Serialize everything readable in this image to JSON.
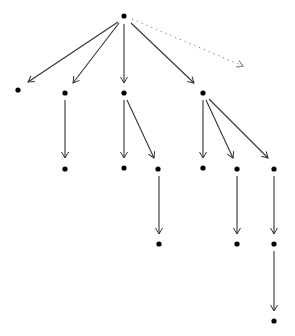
{
  "diagram": {
    "type": "tree",
    "width": 295,
    "height": 336,
    "colors": {
      "node": "#000000",
      "edge": "#333333",
      "dotted_edge": "#777777",
      "background": "#ffffff"
    },
    "node_radius": 2.6,
    "nodes": [
      {
        "id": "root",
        "x": 124,
        "y": 16
      },
      {
        "id": "a",
        "x": 18,
        "y": 90
      },
      {
        "id": "b",
        "x": 65,
        "y": 93
      },
      {
        "id": "c",
        "x": 124,
        "y": 93
      },
      {
        "id": "d",
        "x": 203,
        "y": 93
      },
      {
        "id": "b1",
        "x": 65,
        "y": 169
      },
      {
        "id": "c1",
        "x": 124,
        "y": 168
      },
      {
        "id": "c2",
        "x": 158,
        "y": 169
      },
      {
        "id": "d1",
        "x": 203,
        "y": 168
      },
      {
        "id": "d2",
        "x": 237,
        "y": 169
      },
      {
        "id": "d3",
        "x": 274,
        "y": 169
      },
      {
        "id": "c2a",
        "x": 159,
        "y": 244
      },
      {
        "id": "d2a",
        "x": 237,
        "y": 244
      },
      {
        "id": "d3a",
        "x": 274,
        "y": 244
      },
      {
        "id": "d3a1",
        "x": 274,
        "y": 321
      }
    ],
    "edges": [
      {
        "from": "root",
        "to": "a",
        "x1": 118,
        "y1": 22,
        "x2": 28,
        "y2": 82,
        "style": "solid"
      },
      {
        "from": "root",
        "to": "b",
        "x1": 119,
        "y1": 23,
        "x2": 73,
        "y2": 83,
        "style": "solid"
      },
      {
        "from": "root",
        "to": "c",
        "x1": 124,
        "y1": 24,
        "x2": 124,
        "y2": 83,
        "style": "solid"
      },
      {
        "from": "root",
        "to": "d",
        "x1": 131,
        "y1": 23,
        "x2": 194,
        "y2": 83,
        "style": "solid"
      },
      {
        "from": "root",
        "to": "ghost",
        "x1": 132,
        "y1": 19,
        "x2": 243,
        "y2": 66,
        "style": "dotted"
      },
      {
        "from": "b",
        "to": "b1",
        "x1": 65,
        "y1": 100,
        "x2": 65,
        "y2": 158,
        "style": "solid"
      },
      {
        "from": "c",
        "to": "c1",
        "x1": 124,
        "y1": 100,
        "x2": 124,
        "y2": 158,
        "style": "solid"
      },
      {
        "from": "c",
        "to": "c2",
        "x1": 127,
        "y1": 100,
        "x2": 154,
        "y2": 158,
        "style": "solid"
      },
      {
        "from": "d",
        "to": "d1",
        "x1": 203,
        "y1": 100,
        "x2": 203,
        "y2": 158,
        "style": "solid"
      },
      {
        "from": "d",
        "to": "d2",
        "x1": 206,
        "y1": 100,
        "x2": 233,
        "y2": 158,
        "style": "solid"
      },
      {
        "from": "d",
        "to": "d3",
        "x1": 209,
        "y1": 99,
        "x2": 268,
        "y2": 158,
        "style": "solid"
      },
      {
        "from": "c2",
        "to": "c2a",
        "x1": 159,
        "y1": 176,
        "x2": 159,
        "y2": 234,
        "style": "solid"
      },
      {
        "from": "d2",
        "to": "d2a",
        "x1": 237,
        "y1": 176,
        "x2": 237,
        "y2": 234,
        "style": "solid"
      },
      {
        "from": "d3",
        "to": "d3a",
        "x1": 274,
        "y1": 176,
        "x2": 274,
        "y2": 234,
        "style": "solid"
      },
      {
        "from": "d3a",
        "to": "d3a1",
        "x1": 274,
        "y1": 251,
        "x2": 274,
        "y2": 311,
        "style": "solid"
      }
    ]
  }
}
